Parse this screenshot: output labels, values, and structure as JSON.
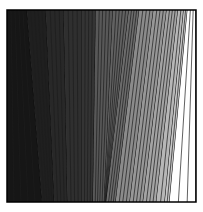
{
  "figure": {
    "title": "",
    "background_color": "#ffffff",
    "width": 203,
    "height": 212
  },
  "plot_area": {
    "x": 7,
    "y": 10,
    "width": 189,
    "height": 192,
    "border_color": "#000000",
    "border_width": 1.5,
    "fill_color": "#ffffff"
  },
  "chart_data": {
    "type": "area",
    "title": "",
    "subtitle": "",
    "xlabel": "",
    "ylabel": "",
    "xlim": [
      0,
      1
    ],
    "ylim": [
      0,
      1
    ],
    "grid": false,
    "legend": null,
    "divider_line_color": "#1c1c1c",
    "divider_line_width": 0.7,
    "band_edge_color": "#0d0d0d",
    "band_edge_width": 1.1,
    "categories": [
      "band-1",
      "band-2",
      "band-3",
      "band-4",
      "band-5",
      "band-6",
      "band-7",
      "band-8",
      "band-9",
      "band-10",
      "band-11",
      "band-12",
      "band-13",
      "band-14"
    ],
    "values": [
      0.085,
      0.12,
      0.155,
      0.185,
      0.205,
      0.345,
      0.385,
      0.425,
      0.545,
      0.595,
      0.645,
      0.72,
      0.78,
      1.0
    ],
    "series": [
      {
        "name": "band-gray-level",
        "values": [
          0.085,
          0.12,
          0.155,
          0.185,
          0.205,
          0.345,
          0.385,
          0.425,
          0.545,
          0.595,
          0.645,
          0.72,
          0.78,
          1.0
        ]
      }
    ],
    "bands": [
      {
        "name": "band-1",
        "fill": "#161616",
        "gray_level": 0.085,
        "top_left": 0.0,
        "top_right": 0.105,
        "bottom_left": 0.0,
        "bottom_right": 0.185,
        "subdivisions": 5
      },
      {
        "name": "band-2",
        "fill": "#1f1f1f",
        "gray_level": 0.12,
        "top_left": 0.105,
        "top_right": 0.205,
        "bottom_left": 0.185,
        "bottom_right": 0.25,
        "subdivisions": 5
      },
      {
        "name": "band-3",
        "fill": "#282828",
        "gray_level": 0.155,
        "top_left": 0.205,
        "top_right": 0.3,
        "bottom_left": 0.25,
        "bottom_right": 0.32,
        "subdivisions": 4
      },
      {
        "name": "band-4",
        "fill": "#2f2f2f",
        "gray_level": 0.185,
        "top_left": 0.3,
        "top_right": 0.395,
        "bottom_left": 0.32,
        "bottom_right": 0.395,
        "subdivisions": 4
      },
      {
        "name": "band-5",
        "fill": "#343434",
        "gray_level": 0.205,
        "top_left": 0.395,
        "top_right": 0.47,
        "bottom_left": 0.395,
        "bottom_right": 0.455,
        "subdivisions": 4
      },
      {
        "name": "band-6",
        "fill": "#585858",
        "gray_level": 0.345,
        "top_left": 0.47,
        "top_right": 0.56,
        "bottom_left": 0.455,
        "bottom_right": 0.515,
        "subdivisions": 5
      },
      {
        "name": "band-7",
        "fill": "#626262",
        "gray_level": 0.385,
        "top_left": 0.56,
        "top_right": 0.645,
        "bottom_left": 0.515,
        "bottom_right": 0.525,
        "subdivisions": 5
      },
      {
        "name": "band-8",
        "fill": "#6c6c6c",
        "gray_level": 0.425,
        "top_left": 0.645,
        "top_right": 0.7,
        "bottom_left": 0.525,
        "bottom_right": 0.575,
        "subdivisions": 4
      },
      {
        "name": "band-9",
        "fill": "#8b8b8b",
        "gray_level": 0.545,
        "top_left": 0.7,
        "top_right": 0.775,
        "bottom_left": 0.575,
        "bottom_right": 0.65,
        "subdivisions": 4
      },
      {
        "name": "band-10",
        "fill": "#979797",
        "gray_level": 0.595,
        "top_left": 0.775,
        "top_right": 0.845,
        "bottom_left": 0.65,
        "bottom_right": 0.72,
        "subdivisions": 4
      },
      {
        "name": "band-11",
        "fill": "#a4a4a4",
        "gray_level": 0.645,
        "top_left": 0.845,
        "top_right": 0.905,
        "bottom_left": 0.72,
        "bottom_right": 0.79,
        "subdivisions": 4
      },
      {
        "name": "band-12",
        "fill": "#b7b7b7",
        "gray_level": 0.72,
        "top_left": 0.905,
        "top_right": 0.935,
        "bottom_left": 0.79,
        "bottom_right": 0.835,
        "subdivisions": 2
      },
      {
        "name": "band-13",
        "fill": "#c7c7c7",
        "gray_level": 0.78,
        "top_left": 0.935,
        "top_right": 0.955,
        "bottom_left": 0.835,
        "bottom_right": 0.86,
        "subdivisions": 2
      },
      {
        "name": "band-14",
        "fill": "#ffffff",
        "gray_level": 1.0,
        "top_left": 0.955,
        "top_right": 1.0,
        "bottom_left": 0.86,
        "bottom_right": 1.0,
        "subdivisions": 3
      }
    ]
  }
}
